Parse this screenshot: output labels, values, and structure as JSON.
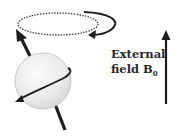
{
  "diagram": {
    "label": {
      "line1": "External",
      "line2_prefix": "field B",
      "line2_subscript": "0"
    },
    "elements": [
      {
        "name": "spinning-nucleus-sphere",
        "shape": "sphere"
      },
      {
        "name": "spin-axis-arrow",
        "shape": "arrow"
      },
      {
        "name": "rotation-arrow",
        "shape": "curved-arrow"
      },
      {
        "name": "precession-path",
        "shape": "dotted-ellipse"
      },
      {
        "name": "precession-direction-arrow",
        "shape": "curved-arrow"
      },
      {
        "name": "external-field-arrow",
        "shape": "arrow"
      }
    ],
    "colors": {
      "stroke": "#1e1e1e",
      "sphere_fill": "#ececec",
      "sphere_edge": "#b8b8b8",
      "text": "#2a2a2a"
    }
  }
}
